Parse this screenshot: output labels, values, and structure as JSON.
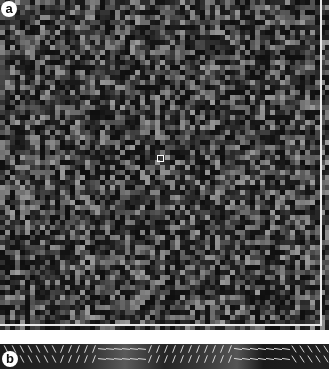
{
  "figure": {
    "panels": [
      {
        "id": "a",
        "label": "a",
        "description": "random grayscale pixel noise texture with white frame and central square marker"
      },
      {
        "id": "b",
        "label": "b",
        "description": "field of oriented line segments with varying orientation bands"
      }
    ],
    "colors": {
      "background": "#1a1a1a",
      "frame": "#e8e8e8",
      "label_bg": "#ffffff",
      "label_text": "#111111"
    }
  }
}
